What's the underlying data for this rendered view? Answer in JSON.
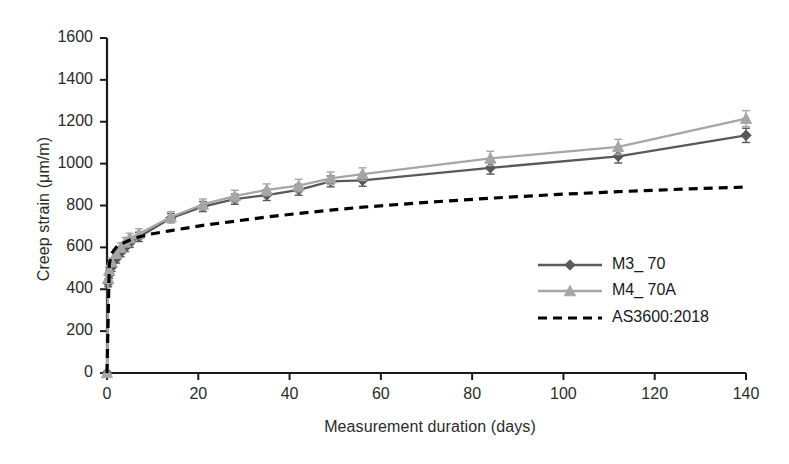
{
  "chart_data": {
    "type": "line",
    "title": "",
    "xlabel": "Measurement duration (days)",
    "ylabel": "Creep strain (μm/m)",
    "xlim": [
      0,
      140
    ],
    "ylim": [
      0,
      1600
    ],
    "xticks": [
      0,
      20,
      40,
      60,
      80,
      100,
      120,
      140
    ],
    "yticks": [
      0,
      200,
      400,
      600,
      800,
      1000,
      1200,
      1400,
      1600
    ],
    "grid": false,
    "legend_position": "inside-right",
    "series": [
      {
        "name": "M3_ 70",
        "color": "#595959",
        "marker": "diamond",
        "line_style": "solid",
        "error_bars": true,
        "x": [
          0,
          0.25,
          0.5,
          1,
          2,
          3,
          4,
          5,
          7,
          14,
          21,
          28,
          35,
          42,
          49,
          56,
          84,
          112,
          140
        ],
        "y": [
          0,
          430,
          470,
          505,
          545,
          575,
          600,
          620,
          650,
          740,
          795,
          830,
          850,
          875,
          915,
          920,
          980,
          1035,
          1135
        ],
        "yerr": [
          0,
          18,
          18,
          20,
          20,
          20,
          20,
          20,
          22,
          22,
          24,
          24,
          26,
          26,
          26,
          28,
          30,
          32,
          34
        ]
      },
      {
        "name": "M4_ 70A",
        "color": "#a6a6a6",
        "marker": "triangle",
        "line_style": "solid",
        "error_bars": true,
        "x": [
          0,
          0.25,
          0.5,
          1,
          2,
          3,
          4,
          5,
          7,
          14,
          21,
          28,
          35,
          42,
          49,
          56,
          84,
          112,
          140
        ],
        "y": [
          0,
          450,
          490,
          530,
          570,
          600,
          625,
          645,
          665,
          745,
          805,
          845,
          875,
          895,
          930,
          950,
          1025,
          1080,
          1215
        ],
        "yerr": [
          0,
          18,
          18,
          20,
          20,
          22,
          22,
          22,
          24,
          26,
          26,
          28,
          28,
          30,
          30,
          30,
          34,
          36,
          38
        ]
      },
      {
        "name": "AS3600:2018",
        "color": "#000000",
        "marker": "none",
        "line_style": "dashed",
        "error_bars": false,
        "x": [
          0,
          0.5,
          1,
          2,
          3,
          5,
          7,
          10,
          14,
          21,
          28,
          35,
          42,
          49,
          56,
          70,
          84,
          98,
          112,
          126,
          140
        ],
        "y": [
          0,
          520,
          570,
          600,
          615,
          635,
          650,
          665,
          680,
          705,
          725,
          745,
          762,
          778,
          792,
          815,
          835,
          852,
          866,
          878,
          888
        ]
      }
    ]
  },
  "legend": {
    "items": [
      {
        "label": "M3_ 70"
      },
      {
        "label": "M4_ 70A"
      },
      {
        "label": "AS3600:2018"
      }
    ]
  },
  "axes": {
    "y_tick_labels": [
      "1600",
      "1400",
      "1200",
      "1000",
      "800",
      "600",
      "400",
      "200",
      "0"
    ],
    "x_tick_labels": [
      "0",
      "20",
      "40",
      "60",
      "80",
      "100",
      "120",
      "140"
    ],
    "x_title": "Measurement duration (days)",
    "y_title": "Creep strain (μm/m)"
  }
}
